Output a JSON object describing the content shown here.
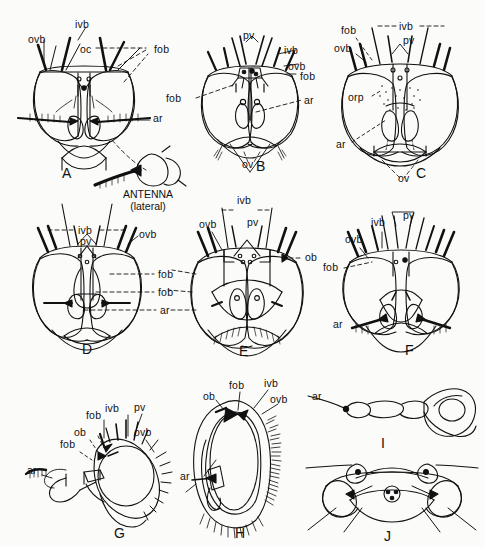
{
  "figure": {
    "background": "#fbfbfa",
    "ink": "#111111",
    "caption_antenna": {
      "line1": "ANTENNA",
      "line2": "(lateral)"
    }
  },
  "panels": [
    {
      "id": "A",
      "letter": "A",
      "view": "frontal head",
      "labels": [
        {
          "text": "ovb",
          "x": 28,
          "y": 33
        },
        {
          "text": "ivb",
          "x": 75,
          "y": 18
        },
        {
          "text": "oc",
          "x": 80,
          "y": 43
        },
        {
          "text": "fob",
          "x": 154,
          "y": 43
        },
        {
          "text": "ar",
          "x": 153,
          "y": 118
        }
      ]
    },
    {
      "id": "B",
      "letter": "B",
      "view": "frontal head",
      "labels": [
        {
          "text": "pv",
          "x": 243,
          "y": 29
        },
        {
          "text": "ivb",
          "x": 284,
          "y": 44
        },
        {
          "text": "ovb",
          "x": 288,
          "y": 60
        },
        {
          "text": "fob",
          "x": 300,
          "y": 72
        },
        {
          "text": "fob",
          "x": 166,
          "y": 94
        },
        {
          "text": "ar",
          "x": 304,
          "y": 96
        },
        {
          "text": "ov",
          "x": 242,
          "y": 160
        }
      ]
    },
    {
      "id": "C",
      "letter": "C",
      "view": "frontal head",
      "labels": [
        {
          "text": "fob",
          "x": 341,
          "y": 26
        },
        {
          "text": "ivb",
          "x": 402,
          "y": 23
        },
        {
          "text": "pv",
          "x": 404,
          "y": 37
        },
        {
          "text": "ovb",
          "x": 336,
          "y": 44
        },
        {
          "text": "orp",
          "x": 350,
          "y": 94
        },
        {
          "text": "ar",
          "x": 338,
          "y": 140
        },
        {
          "text": "ov",
          "x": 400,
          "y": 170
        }
      ]
    },
    {
      "id": "D",
      "letter": "D",
      "view": "frontal head",
      "labels": [
        {
          "text": "ivb",
          "x": 80,
          "y": 226
        },
        {
          "text": "pv",
          "x": 80,
          "y": 236
        },
        {
          "text": "ovb",
          "x": 141,
          "y": 232
        },
        {
          "text": "fob",
          "x": 158,
          "y": 271
        },
        {
          "text": "fob",
          "x": 158,
          "y": 289
        },
        {
          "text": "ar",
          "x": 160,
          "y": 308
        }
      ]
    },
    {
      "id": "E",
      "letter": "E",
      "view": "frontal head",
      "labels": [
        {
          "text": "ivb",
          "x": 237,
          "y": 197
        },
        {
          "text": "ovb",
          "x": 200,
          "y": 220
        },
        {
          "text": "pv",
          "x": 247,
          "y": 218
        },
        {
          "text": "ob",
          "x": 303,
          "y": 254
        }
      ]
    },
    {
      "id": "F",
      "letter": "F",
      "view": "frontal head",
      "labels": [
        {
          "text": "ivb",
          "x": 371,
          "y": 219
        },
        {
          "text": "pv",
          "x": 404,
          "y": 213
        },
        {
          "text": "ovb",
          "x": 347,
          "y": 236
        },
        {
          "text": "fob",
          "x": 327,
          "y": 264
        },
        {
          "text": "ar",
          "x": 334,
          "y": 320
        }
      ]
    },
    {
      "id": "G",
      "letter": "G",
      "view": "lateral head",
      "labels": [
        {
          "text": "fob",
          "x": 87,
          "y": 412
        },
        {
          "text": "ivb",
          "x": 104,
          "y": 405
        },
        {
          "text": "pv",
          "x": 133,
          "y": 403
        },
        {
          "text": "ob",
          "x": 76,
          "y": 428
        },
        {
          "text": "ovb",
          "x": 133,
          "y": 429
        },
        {
          "text": "fob",
          "x": 62,
          "y": 440
        },
        {
          "text": "ar",
          "x": 29,
          "y": 467
        }
      ]
    },
    {
      "id": "H",
      "letter": "H",
      "view": "lateral head",
      "labels": [
        {
          "text": "ob",
          "x": 204,
          "y": 393
        },
        {
          "text": "fob",
          "x": 231,
          "y": 382
        },
        {
          "text": "ivb",
          "x": 266,
          "y": 379
        },
        {
          "text": "ovb",
          "x": 272,
          "y": 396
        },
        {
          "text": "ar",
          "x": 183,
          "y": 473
        }
      ]
    },
    {
      "id": "I",
      "letter": "I",
      "view": "antenna lateral",
      "labels": [
        {
          "text": "ar",
          "x": 313,
          "y": 393
        }
      ]
    },
    {
      "id": "J",
      "letter": "J",
      "view": "head ventral",
      "labels": []
    }
  ],
  "panel_letters": [
    {
      "text": "A",
      "x": 62,
      "y": 165
    },
    {
      "text": "B",
      "x": 256,
      "y": 160
    },
    {
      "text": "C",
      "x": 416,
      "y": 167
    },
    {
      "text": "D",
      "x": 82,
      "y": 343
    },
    {
      "text": "E",
      "x": 239,
      "y": 345
    },
    {
      "text": "F",
      "x": 405,
      "y": 344
    },
    {
      "text": "G",
      "x": 114,
      "y": 527
    },
    {
      "text": "H",
      "x": 235,
      "y": 527
    },
    {
      "text": "I",
      "x": 381,
      "y": 437
    },
    {
      "text": "J",
      "x": 384,
      "y": 530
    }
  ],
  "annotations": {
    "abbreviations": [
      "ovb",
      "ivb",
      "oc",
      "fob",
      "ar",
      "pv",
      "ov",
      "orp",
      "ob"
    ]
  }
}
